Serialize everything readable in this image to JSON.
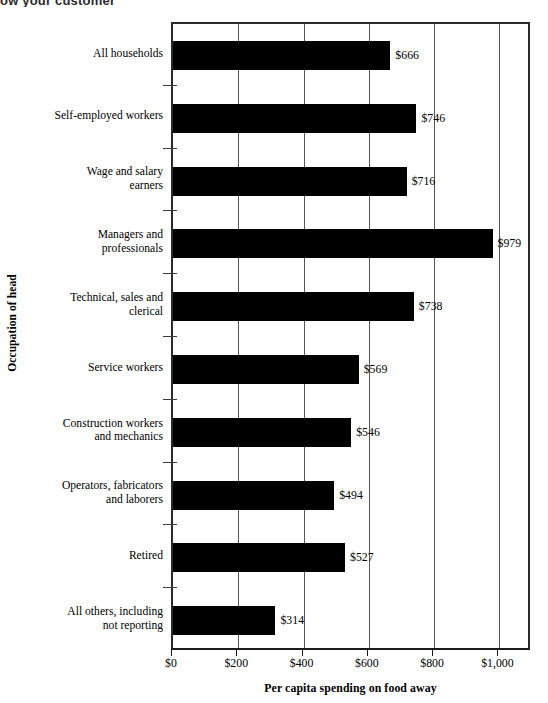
{
  "header": {
    "cut_off_text": "ow your customer"
  },
  "axis": {
    "y_title": "Occupation of head",
    "x_title": "Per capita spending on food away"
  },
  "chart_data": {
    "type": "bar",
    "orientation": "horizontal",
    "title": "",
    "subtitle": "",
    "xlabel": "Per capita spending on food away",
    "ylabel": "Occupation of head",
    "xlim": [
      0,
      1100
    ],
    "grid": true,
    "gridlines": [
      200,
      400,
      600,
      800,
      1000
    ],
    "legend": "none",
    "tick_labels": [
      "$0",
      "$200",
      "$400",
      "$600",
      "$800",
      "$1,000"
    ],
    "tick_values": [
      0,
      200,
      400,
      600,
      800,
      1000
    ],
    "value_prefix": "$",
    "bar_color": "#000000",
    "categories": [
      "All households",
      "Self-employed workers",
      "Wage and salary earners",
      "Managers and professionals",
      "Technical, sales and clerical",
      "Service workers",
      "Construction workers and mechanics",
      "Operators, fabricators and laborers",
      "Retired",
      "All others, including not reporting"
    ],
    "category_lines": [
      [
        "All households"
      ],
      [
        "Self-employed workers"
      ],
      [
        "Wage and salary",
        "earners"
      ],
      [
        "Managers and",
        "professionals"
      ],
      [
        "Technical, sales and",
        "clerical"
      ],
      [
        "Service workers"
      ],
      [
        "Construction workers",
        "and mechanics"
      ],
      [
        "Operators, fabricators",
        "and laborers"
      ],
      [
        "Retired"
      ],
      [
        "All others, including",
        "not reporting"
      ]
    ],
    "values": [
      666,
      746,
      716,
      979,
      738,
      569,
      546,
      494,
      527,
      314
    ],
    "value_labels": [
      "$666",
      "$746",
      "$716",
      "$979",
      "$738",
      "$569",
      "$546",
      "$494",
      "$527",
      "$314"
    ]
  }
}
